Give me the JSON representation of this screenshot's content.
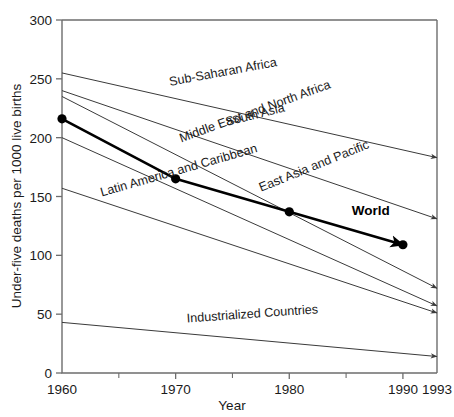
{
  "chart_data": {
    "type": "line",
    "title": "",
    "xlabel": "Year",
    "ylabel": "Under-five deaths per 1000 live births",
    "xlim": [
      1960,
      1993
    ],
    "ylim": [
      0,
      300
    ],
    "x_ticks": [
      1960,
      1970,
      1980,
      1990,
      1993
    ],
    "x_tick_labels": [
      "1960",
      "1970",
      "1980",
      "1990",
      "1993"
    ],
    "x_minor_ticks": [
      1965,
      1975,
      1985
    ],
    "y_ticks": [
      0,
      50,
      100,
      150,
      200,
      250,
      300
    ],
    "y_tick_labels": [
      "0",
      "50",
      "100",
      "150",
      "200",
      "250",
      "300"
    ],
    "grid": false,
    "legend": "inline-labels",
    "line_end_style": "arrow",
    "series": [
      {
        "name": "Sub-Saharan Africa",
        "label": "Sub-Saharan Africa",
        "x": [
          1960,
          1993
        ],
        "values": [
          255,
          183
        ],
        "emphasis": false
      },
      {
        "name": "South Asia",
        "label": "South Asia",
        "x": [
          1960,
          1993
        ],
        "values": [
          240,
          131
        ],
        "emphasis": false
      },
      {
        "name": "Middle East and North Africa",
        "label": "Middle East and North Africa",
        "x": [
          1960,
          1993
        ],
        "values": [
          235,
          72
        ],
        "emphasis": false
      },
      {
        "name": "World",
        "label": "World",
        "x": [
          1960,
          1970,
          1980,
          1990
        ],
        "values": [
          216,
          165,
          137,
          109
        ],
        "emphasis": true,
        "markers": true
      },
      {
        "name": "East Asia and Pacific",
        "label": "East Asia and Pacific",
        "x": [
          1960,
          1993
        ],
        "values": [
          200,
          57
        ],
        "emphasis": false
      },
      {
        "name": "Latin America and Caribbean",
        "label": "Latin America and Caribbean",
        "x": [
          1960,
          1993
        ],
        "values": [
          157,
          51
        ],
        "emphasis": false
      },
      {
        "name": "Industrialized Countries",
        "label": "Industrialized Countries",
        "x": [
          1960,
          1993
        ],
        "values": [
          43,
          14
        ],
        "emphasis": false
      }
    ],
    "annotations": [
      {
        "text": "Sub-Saharan Africa",
        "x": 1969.5,
        "y": 244,
        "rotation": -10.5
      },
      {
        "text": "South Asia",
        "x": 1974.5,
        "y": 210,
        "rotation": -14
      },
      {
        "text": "Middle East and North Africa",
        "x": 1970.5,
        "y": 196,
        "rotation": -20
      },
      {
        "text": "East Asia and Pacific",
        "x": 1977.5,
        "y": 154,
        "rotation": -22
      },
      {
        "text": "Latin America and Caribbean",
        "x": 1963.5,
        "y": 150,
        "rotation": -16
      },
      {
        "text": "Industrialized Countries",
        "x": 1971,
        "y": 43,
        "rotation": -4
      },
      {
        "text": "World",
        "x": 1985.5,
        "y": 134,
        "rotation": 0
      }
    ],
    "colors": {
      "background": "#ffffff",
      "axis": "#6d6d6d",
      "series": "#3a3a3a",
      "world": "#000000",
      "text": "#1a1a1a"
    }
  }
}
